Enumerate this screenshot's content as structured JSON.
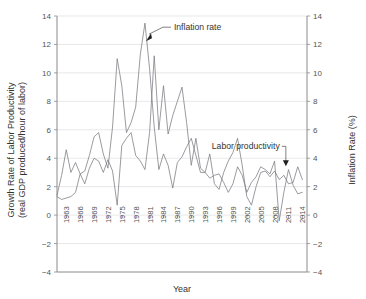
{
  "chart_data": {
    "type": "line",
    "title": "",
    "xlabel": "Year",
    "ylabel": "Growth Rate of Labor Productivity (real GDP produced/hour of labor)",
    "ylabel_line1": "Growth Rate of Labor Productivity",
    "ylabel_line2": "(real GDP produced/hour of labor)",
    "y2label": "Inflation Rate (%)",
    "xlim": [
      1961,
      2015
    ],
    "ylim": [
      -4,
      14
    ],
    "y2lim": [
      -4,
      14
    ],
    "yticks": [
      -4,
      -2,
      0,
      2,
      4,
      6,
      8,
      10,
      12,
      14
    ],
    "y2ticks": [
      -4,
      -2,
      0,
      2,
      4,
      6,
      8,
      10,
      12,
      14
    ],
    "xticks": [
      1963,
      1966,
      1969,
      1972,
      1975,
      1978,
      1981,
      1984,
      1987,
      1990,
      1993,
      1996,
      1999,
      2002,
      2005,
      2008,
      2011,
      2014
    ],
    "grid": "horizontal",
    "legend": "annotations",
    "line_color": "#7a7a80",
    "annotations": [
      {
        "text": "Inflation rate",
        "target_year": 1980,
        "target_value": 12.3
      },
      {
        "text": "Labor productivity",
        "target_year": 2010,
        "target_value": 3.5
      }
    ],
    "x": [
      1961,
      1962,
      1963,
      1964,
      1965,
      1966,
      1967,
      1968,
      1969,
      1970,
      1971,
      1972,
      1973,
      1974,
      1975,
      1976,
      1977,
      1978,
      1979,
      1980,
      1981,
      1982,
      1983,
      1984,
      1985,
      1986,
      1987,
      1988,
      1989,
      1990,
      1991,
      1992,
      1993,
      1994,
      1995,
      1996,
      1997,
      1998,
      1999,
      2000,
      2001,
      2002,
      2003,
      2004,
      2005,
      2006,
      2007,
      2008,
      2009,
      2010,
      2011,
      2012,
      2013,
      2014
    ],
    "series": [
      {
        "name": "Labor productivity",
        "axis": "left",
        "values": [
          1.4,
          2.8,
          4.6,
          3.0,
          3.7,
          2.9,
          2.2,
          3.3,
          4.0,
          3.8,
          3.0,
          3.9,
          3.1,
          0.7,
          4.9,
          5.4,
          5.8,
          4.2,
          3.8,
          3.2,
          5.8,
          11.2,
          6.0,
          9.1,
          5.7,
          7.0,
          8.0,
          9.0,
          6.5,
          3.5,
          5.4,
          3.3,
          3.0,
          4.3,
          2.2,
          1.8,
          3.0,
          3.8,
          4.4,
          5.4,
          3.5,
          1.3,
          0.7,
          2.0,
          3.0,
          3.1,
          2.7,
          3.1,
          2.5,
          2.8,
          2.2,
          2.3,
          3.4,
          2.5
        ]
      },
      {
        "name": "Inflation rate",
        "axis": "right",
        "values": [
          1.3,
          1.1,
          1.2,
          1.3,
          1.6,
          2.9,
          3.1,
          4.2,
          5.5,
          5.8,
          4.3,
          3.3,
          6.2,
          11.0,
          9.1,
          5.8,
          6.5,
          7.6,
          11.3,
          13.5,
          10.3,
          6.2,
          3.2,
          4.3,
          3.5,
          1.9,
          3.7,
          4.1,
          4.8,
          5.4,
          4.2,
          3.0,
          3.0,
          2.6,
          2.8,
          2.9,
          2.3,
          1.6,
          2.2,
          3.4,
          2.8,
          1.6,
          2.3,
          2.7,
          3.4,
          3.2,
          2.9,
          3.8,
          -0.4,
          1.6,
          3.2,
          2.1,
          1.5,
          1.6
        ]
      }
    ]
  }
}
